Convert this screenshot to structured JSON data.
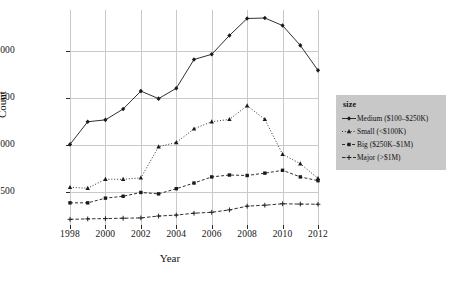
{
  "chart_data": {
    "type": "line",
    "title": "",
    "xlabel": "Year",
    "ylabel": "Count",
    "x": [
      1998,
      1999,
      2000,
      2001,
      2002,
      2003,
      2004,
      2005,
      2006,
      2007,
      2008,
      2009,
      2010,
      2011,
      2012
    ],
    "xlim": [
      1998,
      2012
    ],
    "ylim": [
      150,
      2430
    ],
    "xticks": [
      "1998",
      "2000",
      "2002",
      "2004",
      "2006",
      "2008",
      "2010",
      "2012"
    ],
    "xtick_values": [
      1998,
      2000,
      2002,
      2004,
      2006,
      2008,
      2010,
      2012
    ],
    "yticks": [
      "500",
      "1000",
      "1500",
      "2000"
    ],
    "ytick_values": [
      500,
      1000,
      1500,
      2000
    ],
    "grid": true,
    "grid_color": "#c9c9c9",
    "legend_position": "right",
    "legend_title": "size",
    "series": [
      {
        "name": "Medium ($100–$250K)",
        "marker": "diamond",
        "dash": "solid",
        "color": "#1a1a1a",
        "values": [
          1005,
          1245,
          1265,
          1380,
          1570,
          1490,
          1600,
          1905,
          1960,
          2160,
          2340,
          2345,
          2265,
          2055,
          1790
        ]
      },
      {
        "name": "Small (<$100K)",
        "marker": "triangle",
        "dash": "dotted",
        "color": "#1a1a1a",
        "values": [
          550,
          540,
          635,
          635,
          650,
          980,
          1025,
          1170,
          1245,
          1270,
          1415,
          1270,
          900,
          800,
          645
        ]
      },
      {
        "name": "Big ($250K–$1M)",
        "marker": "square",
        "dash": "dashed",
        "color": "#1a1a1a",
        "values": [
          385,
          385,
          435,
          455,
          495,
          480,
          535,
          595,
          660,
          680,
          675,
          700,
          730,
          660,
          620
        ]
      },
      {
        "name": "Major (>$1M)",
        "marker": "plus",
        "dash": "dashdot",
        "color": "#1a1a1a",
        "values": [
          210,
          215,
          218,
          222,
          225,
          245,
          255,
          275,
          285,
          310,
          350,
          360,
          375,
          372,
          370
        ]
      }
    ]
  },
  "legend": {
    "title": "size",
    "items": [
      {
        "label": "Medium ($100–$250K)",
        "marker": "diamond-marker"
      },
      {
        "label": "Small (<$100K)",
        "marker": "triangle-marker"
      },
      {
        "label": "Big ($250K–$1M)",
        "marker": "square-marker"
      },
      {
        "label": "Major (>$1M)",
        "marker": "plus-marker"
      }
    ]
  },
  "axes": {
    "x_title": "Year",
    "y_title": "Count"
  },
  "colors": {
    "background": "#ffffff",
    "grid": "#c9c9c9",
    "ink": "#1a1a1a",
    "legend_panel": "#c8c8c8"
  }
}
